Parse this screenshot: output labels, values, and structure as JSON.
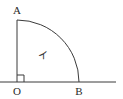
{
  "diagram": {
    "type": "quarter-circle-sector",
    "points": {
      "A": {
        "label": "A"
      },
      "O": {
        "label": "O"
      },
      "B": {
        "label": "B"
      }
    },
    "region_label": "イ",
    "right_angle_at": "O",
    "colors": {
      "stroke": "#3a3a3a",
      "background": "#ffffff"
    }
  }
}
